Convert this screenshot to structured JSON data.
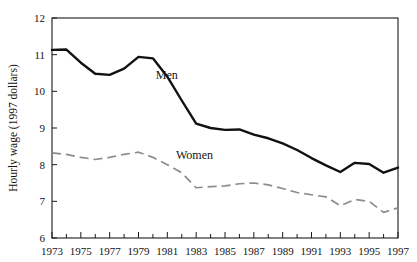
{
  "chart_data": {
    "type": "line",
    "title": "",
    "subtitle": "",
    "xlabel": "",
    "ylabel": "Hourly wage (1997 dollars)",
    "xlim": [
      1973,
      1997
    ],
    "ylim": [
      6,
      12
    ],
    "grid": false,
    "legend_position": "inline-annotations",
    "x": [
      1973,
      1974,
      1975,
      1976,
      1977,
      1978,
      1979,
      1980,
      1981,
      1982,
      1983,
      1984,
      1985,
      1986,
      1987,
      1988,
      1989,
      1990,
      1991,
      1992,
      1993,
      1994,
      1995,
      1996,
      1997
    ],
    "x_tick_labels": [
      "1973",
      "1975",
      "1977",
      "1979",
      "1981",
      "1983",
      "1985",
      "1987",
      "1989",
      "1991",
      "1993",
      "1995",
      "1997"
    ],
    "x_tick_values": [
      1973,
      1975,
      1977,
      1979,
      1981,
      1983,
      1985,
      1987,
      1989,
      1991,
      1993,
      1995,
      1997
    ],
    "y_tick_labels": [
      "6",
      "7",
      "8",
      "9",
      "10",
      "11",
      "12"
    ],
    "y_tick_values": [
      6,
      7,
      8,
      9,
      10,
      11,
      12
    ],
    "series": [
      {
        "name": "Men",
        "style": "solid",
        "color": "#111111",
        "label_x": 1980.2,
        "label_y": 10.35,
        "values": [
          11.13,
          11.14,
          10.78,
          10.48,
          10.45,
          10.62,
          10.94,
          10.9,
          10.4,
          9.75,
          9.12,
          9.0,
          8.95,
          8.96,
          8.82,
          8.72,
          8.58,
          8.4,
          8.18,
          7.98,
          7.8,
          8.05,
          8.02,
          7.78,
          7.92
        ]
      },
      {
        "name": "Women",
        "style": "dashed",
        "color": "#8c8c8c",
        "label_x": 1981.6,
        "label_y": 8.15,
        "values": [
          8.32,
          8.28,
          8.2,
          8.14,
          8.2,
          8.28,
          8.34,
          8.2,
          8.0,
          7.78,
          7.37,
          7.4,
          7.42,
          7.48,
          7.5,
          7.45,
          7.35,
          7.24,
          7.18,
          7.12,
          6.88,
          7.05,
          7.0,
          6.7,
          6.82
        ]
      }
    ]
  }
}
